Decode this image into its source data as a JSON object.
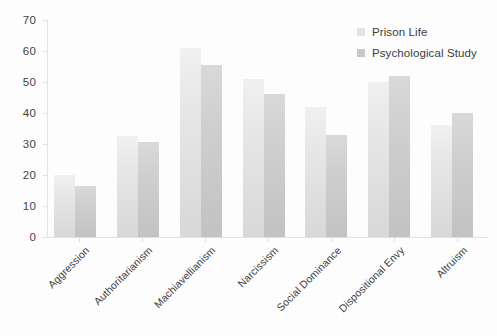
{
  "chart_data": {
    "type": "bar",
    "title": "",
    "subtitle": "",
    "xlabel": "",
    "ylabel": "",
    "ylim": [
      0,
      70
    ],
    "ytick_step": 10,
    "yticks": [
      0,
      10,
      20,
      30,
      40,
      50,
      60,
      70
    ],
    "grid": false,
    "legend_position": "top-right",
    "xtick_rotation": -45,
    "categories": [
      "Aggression",
      "Authoritarianism",
      "Machiavellianism",
      "Narcissism",
      "Social Dominance",
      "Dispositional Envy",
      "Altruism"
    ],
    "series": [
      {
        "name": "Prison Life",
        "color": "#e2e2e2",
        "values": [
          20,
          32.5,
          61,
          51,
          42,
          50,
          36
        ]
      },
      {
        "name": "Psychological Study",
        "color": "#c9c9c9",
        "values": [
          16.5,
          30.5,
          55.5,
          46,
          33,
          52,
          40
        ]
      }
    ]
  },
  "legend": {
    "items": [
      {
        "label": "Prison Life"
      },
      {
        "label": "Psychological Study"
      }
    ]
  }
}
